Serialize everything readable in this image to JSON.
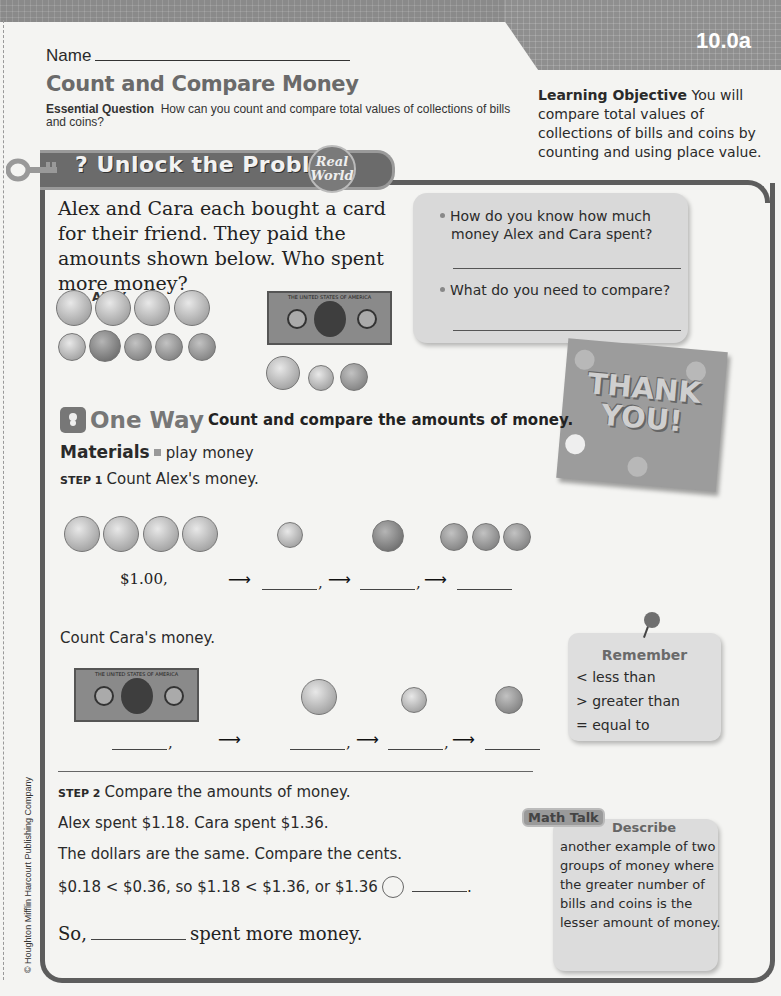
{
  "header": {
    "lesson_number": "10.0a",
    "name_label": "Name",
    "title": "Count and Compare Money",
    "essential_question_label": "Essential Question",
    "essential_question": "How can you count and compare total values of collections of bills and coins?",
    "learning_objective_label": "Learning Objective",
    "learning_objective": "You will compare total values of collections of bills and coins by counting and using place value."
  },
  "banner": {
    "title": "Unlock the Problem",
    "badge_line1": "Real",
    "badge_line2": "World"
  },
  "problem": {
    "text": "Alex and Cara each bought a card for their friend. They paid the amounts shown below. Who spent more money?",
    "alex_label": "ALEX",
    "cara_label": "CARA",
    "alex_money": [
      "quarter",
      "quarter",
      "quarter",
      "quarter",
      "dime",
      "nickel",
      "penny",
      "penny",
      "penny"
    ],
    "cara_money": [
      "one-dollar bill",
      "quarter",
      "dime",
      "penny"
    ]
  },
  "questions": [
    {
      "text": "How do you know how much money Alex and Cara spent?"
    },
    {
      "text": "What do you need to compare?"
    }
  ],
  "card": {
    "text_line1": "THANK",
    "text_line2": "YOU!"
  },
  "one_way": {
    "title": "One Way",
    "subtitle": "Count and compare the amounts of money.",
    "materials_label": "Materials",
    "materials": "play money"
  },
  "step1": {
    "label": "STEP 1",
    "text": "Count Alex's money.",
    "first_amount": "$1.00,",
    "cara_text": "Count Cara's money."
  },
  "remember": {
    "title": "Remember",
    "items": [
      "< less than",
      "> greater than",
      "= equal to"
    ]
  },
  "step2": {
    "label": "STEP 2",
    "text": "Compare the amounts of money.",
    "spent_line": "Alex spent $1.18. Cara spent $1.36.",
    "dollars_line": "The dollars are the same. Compare the cents.",
    "compare_line": "$0.18 < $0.36, so $1.18 < $1.36, or $1.36",
    "so_prefix": "So,",
    "so_suffix": "spent more money."
  },
  "math_talk": {
    "tag": "Math Talk",
    "lead": "Describe",
    "body": "another example of two groups of money where the greater number of bills and coins is the lesser amount of money."
  },
  "bill": {
    "top_text": "THE UNITED STATES OF AMERICA",
    "bottom_text": "ONE DOLLAR"
  },
  "footer": {
    "copyright": "© Houghton Mifflin Harcourt Publishing Company"
  }
}
